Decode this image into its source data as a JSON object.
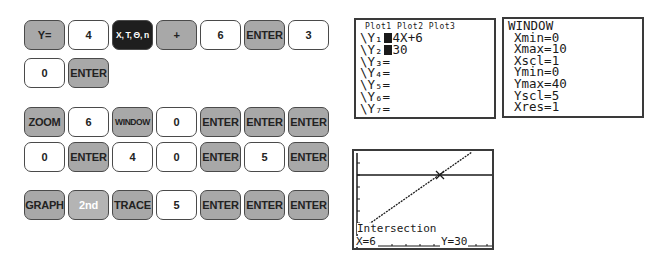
{
  "keypad": {
    "rows": [
      {
        "keys": [
          {
            "label": "Y=",
            "style": "func"
          },
          {
            "label": "4",
            "style": "num"
          },
          {
            "label": "X, T, Θ, n",
            "style": "dark"
          },
          {
            "label": "+",
            "style": "func"
          },
          {
            "label": "6",
            "style": "num"
          },
          {
            "label": "ENTER",
            "style": "func"
          },
          {
            "label": "3",
            "style": "num"
          }
        ]
      },
      {
        "keys": [
          {
            "label": "0",
            "style": "num"
          },
          {
            "label": "ENTER",
            "style": "func"
          }
        ]
      },
      {
        "keys": [
          {
            "label": "ZOOM",
            "style": "func"
          },
          {
            "label": "6",
            "style": "num"
          },
          {
            "label": "WINDOW",
            "style": "func"
          },
          {
            "label": "0",
            "style": "num"
          },
          {
            "label": "ENTER",
            "style": "func"
          },
          {
            "label": "ENTER",
            "style": "func"
          },
          {
            "label": "ENTER",
            "style": "func"
          }
        ]
      },
      {
        "keys": [
          {
            "label": "0",
            "style": "num"
          },
          {
            "label": "ENTER",
            "style": "func"
          },
          {
            "label": "4",
            "style": "num"
          },
          {
            "label": "0",
            "style": "num"
          },
          {
            "label": "ENTER",
            "style": "func"
          },
          {
            "label": "5",
            "style": "num"
          },
          {
            "label": "ENTER",
            "style": "func"
          }
        ]
      },
      {
        "keys": [
          {
            "label": "GRAPH",
            "style": "func"
          },
          {
            "label": "2nd",
            "style": "second"
          },
          {
            "label": "TRACE",
            "style": "func"
          },
          {
            "label": "5",
            "style": "num"
          },
          {
            "label": "ENTER",
            "style": "func"
          },
          {
            "label": "ENTER",
            "style": "func"
          },
          {
            "label": "ENTER",
            "style": "func"
          }
        ]
      }
    ]
  },
  "y_editor": {
    "plots": "Plot1  Plot2  Plot3",
    "equations": [
      {
        "name": "\\Y₁",
        "selected": true,
        "expr": "4X+6"
      },
      {
        "name": "\\Y₂",
        "selected": true,
        "expr": "30"
      },
      {
        "name": "\\Y₃",
        "selected": false,
        "expr": "="
      },
      {
        "name": "\\Y₄",
        "selected": false,
        "expr": "="
      },
      {
        "name": "\\Y₅",
        "selected": false,
        "expr": "="
      },
      {
        "name": "\\Y₆",
        "selected": false,
        "expr": "="
      },
      {
        "name": "\\Y₇",
        "selected": false,
        "expr": "="
      }
    ]
  },
  "window": {
    "title": "WINDOW",
    "settings": [
      "Xmin=0",
      "Xmax=10",
      "Xscl=1",
      "Ymin=0",
      "Ymax=40",
      "Yscl=5",
      "Xres=1"
    ]
  },
  "graph": {
    "label": "Intersection",
    "x_readout": "X=6",
    "y_readout": "Y=30",
    "xmin": 0,
    "xmax": 10,
    "ymin": 0,
    "ymax": 40,
    "line_color": "#1a1a1a"
  }
}
